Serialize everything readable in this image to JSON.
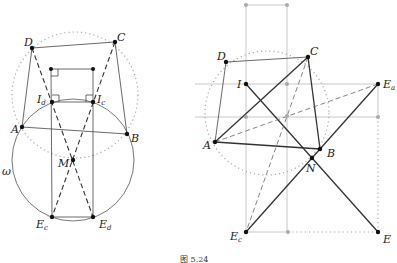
{
  "figure": {
    "caption": "图 5.24",
    "left_panel": {
      "circle_label": "ω",
      "points": {
        "A": "A",
        "B": "B",
        "C": "C",
        "D": "D",
        "M": "M",
        "Id": {
          "base": "I",
          "sub": "d"
        },
        "Ic": {
          "base": "I",
          "sub": "c"
        },
        "Ec": {
          "base": "E",
          "sub": "c"
        },
        "Ed": {
          "base": "E",
          "sub": "d"
        }
      }
    },
    "right_panel": {
      "points": {
        "A": "A",
        "B": "B",
        "C": "C",
        "D": "D",
        "I": "I",
        "N": "N",
        "E": "E",
        "Ea": {
          "base": "E",
          "sub": "a"
        },
        "Ec": {
          "base": "E",
          "sub": "c"
        }
      }
    }
  }
}
